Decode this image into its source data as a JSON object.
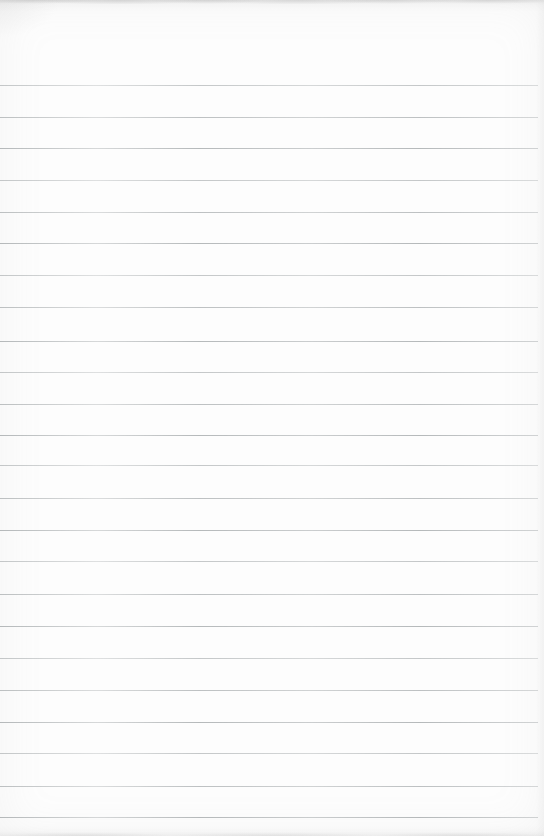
{
  "page": {
    "paper_color": "#fdfdfd",
    "line_color": "#9fa4a6",
    "top_edge": "faint torn-paper mottled gray edge",
    "bottom_edge": "faint gray shading band",
    "ruled_lines": {
      "count": 24,
      "left_x": 0,
      "right_x": 538,
      "thickness_px": 1,
      "y_positions": [
        85,
        117,
        148,
        180,
        212,
        243,
        275,
        307,
        341,
        372,
        404,
        435,
        465,
        498,
        530,
        561,
        594,
        626,
        658,
        690,
        722,
        753,
        786,
        817
      ]
    }
  }
}
